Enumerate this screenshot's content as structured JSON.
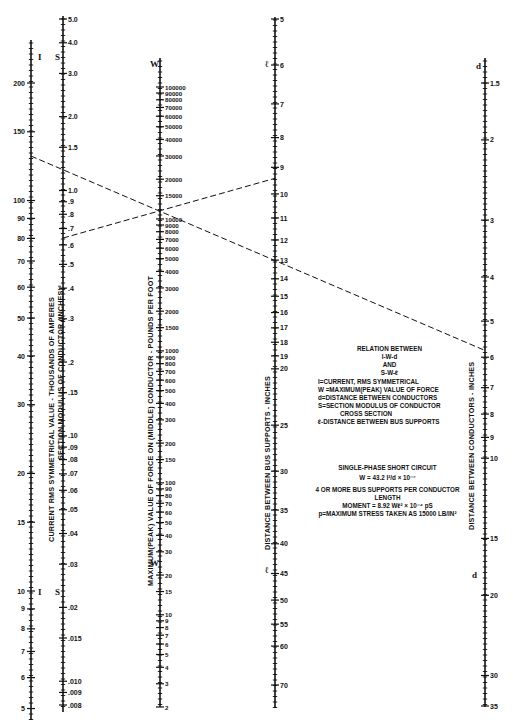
{
  "chart_data": {
    "type": "nomogram",
    "scales": [
      {
        "id": "I",
        "letter": "I",
        "title": "CURRENT RMS SYMMETRICAL VALUE - THOUSANDS OF AMPERES",
        "scale": "log",
        "ticks": [
          200,
          150,
          100,
          90,
          80,
          70,
          60,
          50,
          40,
          30,
          20,
          15,
          10,
          9,
          8,
          7,
          6,
          5,
          4
        ]
      },
      {
        "id": "S",
        "letter": "S",
        "title": "SECTION MODULUS OF CONDUCTOR (INCHES)³",
        "scale": "log",
        "ticks": [
          "5.0",
          "4.0",
          "3.0",
          "2.0",
          "1.5",
          "1.0",
          ".9",
          ".8",
          ".7",
          ".6",
          ".5",
          ".4",
          ".3",
          ".2",
          ".15",
          ".10",
          ".09",
          ".08",
          ".07",
          ".06",
          ".05",
          ".04",
          ".03",
          ".02",
          ".015",
          ".010",
          ".009",
          ".008"
        ]
      },
      {
        "id": "W",
        "letter": "W",
        "title": "MAXIMUM(PEAK) VALUE OF FORCE ON (MIDDLE) CONDUCTOR - POUNDS PER FOOT",
        "scale": "log",
        "ticks": [
          100000,
          90000,
          80000,
          70000,
          60000,
          50000,
          40000,
          30000,
          20000,
          15000,
          10000,
          9000,
          8000,
          7000,
          6000,
          5000,
          4000,
          3000,
          2000,
          1500,
          1000,
          900,
          800,
          700,
          600,
          500,
          400,
          300,
          200,
          150,
          100,
          90,
          80,
          70,
          60,
          50,
          40,
          30,
          20,
          15,
          10,
          9,
          8,
          7,
          6,
          5,
          4,
          3,
          2
        ]
      },
      {
        "id": "L",
        "letter": "ℓ",
        "title": "DISTANCE BETWEEN BUS SUPPORTS - INCHES",
        "scale": "log",
        "ticks": [
          5,
          6,
          7,
          8,
          9,
          10,
          11,
          12,
          13,
          14,
          15,
          16,
          17,
          18,
          19,
          20,
          25,
          30,
          35,
          40,
          45,
          50,
          55,
          60,
          70
        ]
      },
      {
        "id": "d",
        "letter": "d",
        "title": "DISTANCE BETWEEN CONDUCTORS - INCHES",
        "scale": "log",
        "ticks": [
          1.5,
          2,
          3,
          4,
          5,
          6,
          7,
          8,
          9,
          10,
          15,
          20,
          30,
          35
        ]
      }
    ],
    "example_lines": [
      {
        "name": "I-W-d",
        "points": [
          [
            "I",
            130
          ],
          [
            "W",
            11500
          ],
          [
            "d",
            5.8
          ]
        ],
        "style": "dashed"
      },
      {
        "name": "S-W-ℓ",
        "points": [
          [
            "S",
            0.64
          ],
          [
            "W",
            11500
          ],
          [
            "L",
            9.4
          ]
        ],
        "style": "dashed"
      }
    ]
  },
  "diagram": {
    "relation_title": [
      "RELATION BETWEEN",
      "I-W-d",
      "AND",
      "S-W-ℓ"
    ],
    "definitions": [
      "I=CURRENT, RMS SYMMETRICAL",
      "W =MAXIMUM(PEAK) VALUE OF FORCE",
      "d=DISTANCE BETWEEN CONDUCTORS",
      "S=SECTION MODULUS OF CONDUCTOR",
      "CROSS SECTION",
      "ℓ-DISTANCE BETWEEN BUS SUPPORTS"
    ],
    "formula_title": "SINGLE-PHASE SHORT CIRCUIT",
    "formula_1": "W = 43.2 I²/d × 10⁻⁷",
    "formula_note": "4 OR MORE BUS SUPPORTS PER CONDUCTOR LENGTH",
    "formula_2": "MOMENT = 8.92 Wℓ² × 10⁻⁴ pS",
    "formula_3": "p=MAXIMUM STRESS TAKEN AS 15000 LB/IN²"
  }
}
